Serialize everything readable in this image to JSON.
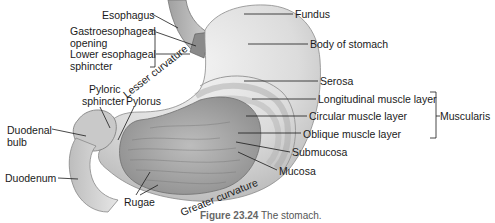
{
  "caption": {
    "number": "Figure 23.24",
    "text": "The stomach."
  },
  "labels": {
    "esophagus": "Esophagus",
    "gastroesophageal_opening_1": "Gastroesophageal",
    "gastroesophageal_opening_2": "opening",
    "lower_esophageal_sphincter_1": "Lower esophageal",
    "lower_esophageal_sphincter_2": "sphincter",
    "pyloric_sphincter_1": "Pyloric",
    "pyloric_sphincter_2": "sphincter",
    "pylorus": "Pylorus",
    "duodenal_bulb_1": "Duodenal",
    "duodenal_bulb_2": "bulb",
    "duodenum": "Duodenum",
    "rugae": "Rugae",
    "lesser_curvature": "Lesser curvature",
    "greater_curvature": "Greater curvature",
    "fundus": "Fundus",
    "body_of_stomach": "Body of stomach",
    "serosa": "Serosa",
    "longitudinal_muscle_layer": "Longitudinal muscle layer",
    "circular_muscle_layer": "Circular muscle layer",
    "oblique_muscle_layer": "Oblique muscle layer",
    "submucosa": "Submucosa",
    "mucosa": "Mucosa",
    "muscularis": "Muscularis"
  },
  "colors": {
    "outer_wall": "#d9d9d9",
    "inner_mucosa": "#a9a9a9",
    "leader_lines": "#1a1a1a"
  }
}
